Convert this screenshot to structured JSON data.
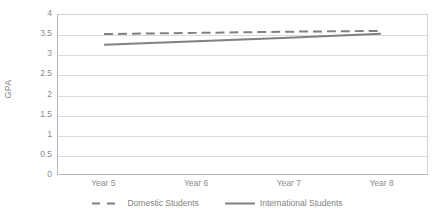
{
  "chart_data": {
    "type": "line",
    "title": "",
    "xlabel": "",
    "ylabel": "GPA",
    "categories": [
      "Year 5",
      "Year 6",
      "Year 7",
      "Year 8"
    ],
    "x": [
      5,
      6,
      7,
      8
    ],
    "series": [
      {
        "name": "Domestic Students",
        "style": "dashed",
        "color": "#808080",
        "values": [
          3.52,
          3.55,
          3.58,
          3.6
        ]
      },
      {
        "name": "International Students",
        "style": "solid",
        "color": "#808080",
        "values": [
          3.25,
          3.34,
          3.43,
          3.53
        ]
      }
    ],
    "ylim": [
      0,
      4
    ],
    "yticks": [
      "4",
      "3.5",
      "3",
      "2.5",
      "2",
      "1.5",
      "1",
      "0.5",
      "0"
    ],
    "ytick_values": [
      4,
      3.5,
      3,
      2.5,
      2,
      1.5,
      1,
      0.5,
      0
    ],
    "grid": true,
    "legend_position": "bottom",
    "colors": {
      "line": "#808080",
      "gridline": "#d9d9d9",
      "axis": "#b5b5b5",
      "text": "#808080",
      "background": "#ffffff"
    }
  }
}
